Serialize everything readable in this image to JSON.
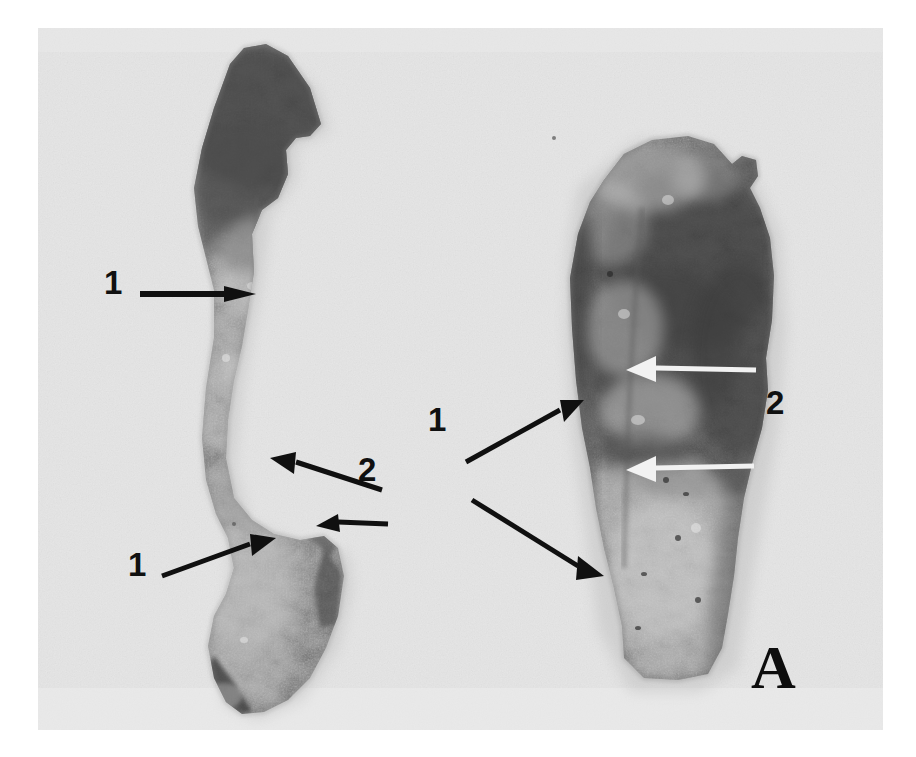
{
  "figure": {
    "type": "gross-pathology-photograph",
    "panel_letter": "A",
    "background_color": "#e3e3e3",
    "page_color": "#ffffff",
    "ink_color": "#101010",
    "specimen_count": 2
  },
  "annotations": {
    "left_specimen": [
      {
        "id": "left-1-top",
        "label": "1",
        "arrow_color": "#101010",
        "arrow_style": "solid-black",
        "direction": "right"
      },
      {
        "id": "left-2-upper",
        "label": "2",
        "arrow_color": "#101010",
        "arrow_style": "solid-black",
        "direction": "up-left"
      },
      {
        "id": "left-2-lower",
        "label": "2",
        "arrow_color": "#101010",
        "arrow_style": "solid-black",
        "direction": "left"
      },
      {
        "id": "left-1-bottom",
        "label": "1",
        "arrow_color": "#101010",
        "arrow_style": "solid-black",
        "direction": "up-right"
      }
    ],
    "right_specimen": [
      {
        "id": "right-1-upper",
        "label": "1",
        "arrow_color": "#101010",
        "arrow_style": "solid-black",
        "direction": "up-right"
      },
      {
        "id": "right-1-lower",
        "label": "1",
        "arrow_color": "#101010",
        "arrow_style": "solid-black",
        "direction": "down-right"
      },
      {
        "id": "right-2-upper",
        "label": "2",
        "arrow_color": "#f2f2f2",
        "arrow_style": "solid-white",
        "direction": "left"
      },
      {
        "id": "right-2-lower",
        "label": "2",
        "arrow_color": "#f2f2f2",
        "arrow_style": "solid-white",
        "direction": "left"
      }
    ]
  },
  "labels": {
    "left_1_top": "1",
    "left_2": "2",
    "left_1_bottom": "1",
    "right_1": "1",
    "right_2": "2",
    "panel": "A"
  }
}
